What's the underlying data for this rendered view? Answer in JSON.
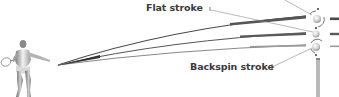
{
  "diagram": {
    "labels": {
      "flat": "Flat stroke",
      "backspin": "Backspin stroke"
    },
    "strokes": [
      {
        "name": "Topspin stroke (label cropped)",
        "color": "#4a4a4a",
        "ball_spin": "forward"
      },
      {
        "name": "Flat stroke",
        "color": "#555555",
        "ball_spin": "none"
      },
      {
        "name": "Backspin stroke",
        "color": "#8a8a8a",
        "ball_spin": "backward"
      }
    ],
    "colors": {
      "text": "#3a3a3a",
      "trajectory_dark": "#4a4a4a",
      "trajectory_mid": "#5a5a5a",
      "trajectory_light": "#909090",
      "ball": "#cfcfcf",
      "post": "#9a9a9a",
      "leader": "#6a6a6a"
    }
  }
}
